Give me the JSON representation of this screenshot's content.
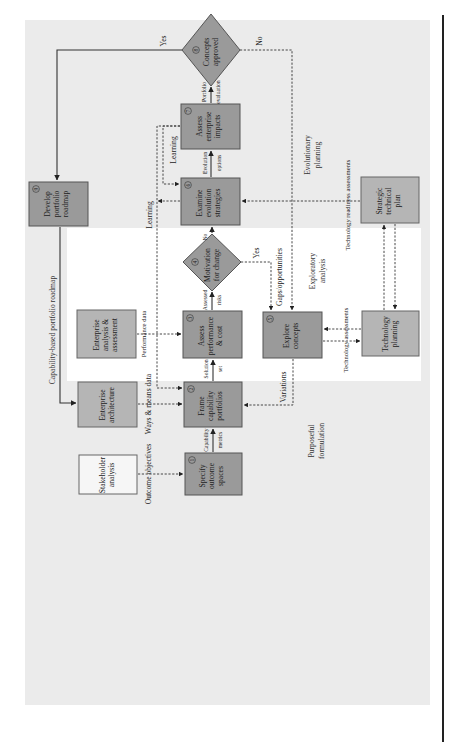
{
  "diagram": {
    "orientation": "rotated 90° counter-clockwise",
    "zones": {
      "purposeful": [
        "Purposeful",
        "formulation"
      ],
      "exploratory": [
        "Exploratory",
        "analysis"
      ],
      "evolutionary": [
        "Evolutionary",
        "planning"
      ]
    },
    "nodes": {
      "n1": {
        "num": "1",
        "lines": [
          "Specify",
          "outcome",
          "spaces"
        ]
      },
      "n2": {
        "num": "2",
        "lines": [
          "Frame",
          "capability",
          "portfolios"
        ]
      },
      "n3": {
        "num": "3",
        "lines": [
          "Assess",
          "performance",
          "& cost"
        ]
      },
      "n4": {
        "num": "4",
        "lines": [
          "Motivation",
          "for change"
        ]
      },
      "n5": {
        "num": "5",
        "lines": [
          "Explore",
          "concepts"
        ]
      },
      "n6": {
        "num": "6",
        "lines": [
          "Examine",
          "evolution",
          "strategies"
        ]
      },
      "n7": {
        "num": "7",
        "lines": [
          "Assess",
          "enterprise",
          "impacts"
        ]
      },
      "n8": {
        "num": "8",
        "lines": [
          "Concepts",
          "approved"
        ]
      },
      "n9": {
        "num": "9",
        "lines": [
          "Develop",
          "portfolio",
          "roadmap"
        ]
      },
      "stakeholder": {
        "lines": [
          "Stakeholder",
          "analysis"
        ]
      },
      "ent_arch": {
        "lines": [
          "Enterprise",
          "architecture"
        ]
      },
      "ent_analysis": {
        "lines": [
          "Enterprise",
          "analysis &",
          "assessment"
        ]
      },
      "tech_planning": {
        "lines": [
          "Technology",
          "planning"
        ]
      },
      "strategic": {
        "lines": [
          "Strategic",
          "technical",
          "plan"
        ]
      }
    },
    "edge_labels": {
      "outcome_objectives": "Outcome objectives",
      "ways_means": "Ways & means data",
      "performance_data": "Performance data",
      "capability_metrics": [
        "Capability",
        "metrics"
      ],
      "solution_set": [
        "Solution",
        "set"
      ],
      "assessed_risks": [
        "Assessed",
        "risks"
      ],
      "no4": "No",
      "yes4": "Yes",
      "gaps": "Gaps/opportunities",
      "evolution_options": [
        "Evolution",
        "options"
      ],
      "portfolio_evaluation": [
        "Portfolio",
        "evaluation"
      ],
      "yes8": "Yes",
      "no8": "No",
      "learning_a": "Learning",
      "learning_b": "Learning",
      "variations": "Variations",
      "tech_assessments": "Technology assessments",
      "tech_readiness": "Technology readiness assessments",
      "roadmap": "Capability-based portfolio roadmap"
    }
  }
}
